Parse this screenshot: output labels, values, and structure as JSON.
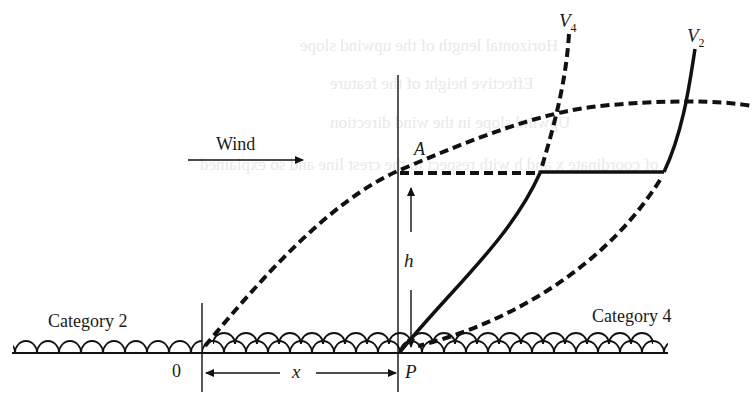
{
  "diagram": {
    "type": "wind-profile-schematic",
    "wind_label": "Wind",
    "point_A": "A",
    "point_P": "P",
    "origin_label": "0",
    "height_label": "h",
    "distance_label": "x",
    "curves": {
      "v4": {
        "label": "V",
        "subscript": "4"
      },
      "v2": {
        "label": "V",
        "subscript": "2"
      }
    },
    "terrain": {
      "left": "Category 2",
      "right": "Category 4"
    }
  },
  "bleed_through_text": [
    "Horizontal length of the upwind slope",
    "Effective height of the feature",
    "Upwind slope in the wind direction",
    "of coordinate x and h with respect to the crest line and so explained",
    "K, T (X)",
    "0.22/(for 0 = 3° to 17°) and ... = 0.36 (for ... > 17°). Here ... is",
    "ratio ...",
    "the formation is different from that of ... and development only on"
  ]
}
